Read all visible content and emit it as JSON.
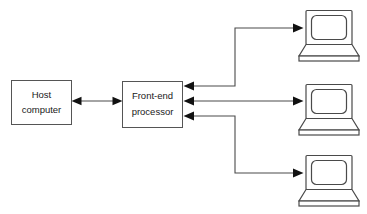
{
  "diagram": {
    "background_color": "#ffffff",
    "line_color": "#4a4a4a",
    "arrow_color": "#111111",
    "box_stroke_color": "#555555",
    "text_color": "#1a1a1a",
    "nodes": [
      {
        "id": "host-computer",
        "type": "box",
        "label_line1": "Host",
        "label_line2": "computer",
        "x": 11,
        "y": 80,
        "width": 60,
        "height": 45
      },
      {
        "id": "front-end-processor",
        "type": "box",
        "label_line1": "Front-end",
        "label_line2": "processor",
        "x": 122,
        "y": 81,
        "width": 61,
        "height": 47
      },
      {
        "id": "terminal-top",
        "type": "laptop",
        "label": "terminal",
        "x": 303,
        "y": 10,
        "width": 56,
        "height": 52
      },
      {
        "id": "terminal-middle",
        "type": "laptop",
        "label": "terminal",
        "x": 303,
        "y": 84,
        "width": 56,
        "height": 52
      },
      {
        "id": "terminal-bottom",
        "type": "laptop",
        "label": "terminal",
        "x": 303,
        "y": 155,
        "width": 56,
        "height": 52
      }
    ],
    "connections": [
      {
        "id": "host-to-processor",
        "from": "host-computer",
        "to": "front-end-processor",
        "style": "bidirectional",
        "path": "M 75 101 L 119 101"
      },
      {
        "id": "processor-to-terminal-top",
        "from": "terminal-top",
        "to": "front-end-processor",
        "style": "elbow-up",
        "path": "M 188 86 L 235 86 L 235 28 L 298 28"
      },
      {
        "id": "processor-to-terminal-middle",
        "from": "front-end-processor",
        "to": "terminal-middle",
        "style": "bidirectional-straight",
        "path": "M 188 101 L 298 101"
      },
      {
        "id": "processor-to-terminal-bottom",
        "from": "terminal-bottom",
        "to": "front-end-processor",
        "style": "elbow-down",
        "path": "M 188 116 L 235 116 L 235 173 L 298 173"
      }
    ]
  }
}
